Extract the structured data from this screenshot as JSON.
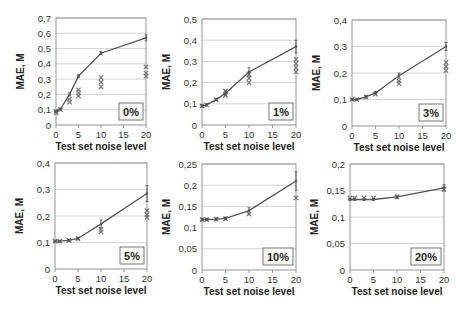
{
  "chart_data": [
    {
      "type": "line",
      "tag": "0%",
      "xlabel": "Test set noise level",
      "ylabel": "MAE, M",
      "xlim": [
        0,
        20
      ],
      "ylim": [
        0,
        0.7
      ],
      "xticks": [
        "0",
        "5",
        "10",
        "15",
        "20"
      ],
      "yticks": [
        "0",
        "0,1",
        "0,2",
        "0,3",
        "0,4",
        "0,5",
        "0,6",
        "0,7"
      ],
      "grid": true,
      "series": [
        {
          "name": "line",
          "x": [
            0,
            1,
            3,
            5,
            10,
            20
          ],
          "y": [
            0.09,
            0.105,
            0.2,
            0.32,
            0.47,
            0.57
          ],
          "err": [
            0.005,
            0.005,
            0.01,
            0.01,
            0.01,
            0.02
          ]
        },
        {
          "name": "markers",
          "x": [
            0,
            0,
            1,
            3,
            3,
            5,
            5,
            5,
            10,
            10,
            10,
            20,
            20,
            20
          ],
          "y": [
            0.08,
            0.09,
            0.1,
            0.15,
            0.17,
            0.19,
            0.21,
            0.23,
            0.25,
            0.28,
            0.31,
            0.32,
            0.34,
            0.38
          ]
        }
      ]
    },
    {
      "type": "line",
      "tag": "1%",
      "xlabel": "Test set noise level",
      "ylabel": "MAE, M",
      "xlim": [
        0,
        20
      ],
      "ylim": [
        0,
        0.5
      ],
      "xticks": [
        "0",
        "5",
        "10",
        "15",
        "20"
      ],
      "yticks": [
        "0",
        "0,1",
        "0,2",
        "0,3",
        "0,4",
        "0,5"
      ],
      "grid": true,
      "series": [
        {
          "name": "line",
          "x": [
            0,
            1,
            3,
            5,
            10,
            20
          ],
          "y": [
            0.09,
            0.095,
            0.12,
            0.15,
            0.25,
            0.37
          ],
          "err": [
            0.005,
            0.005,
            0.005,
            0.01,
            0.02,
            0.03
          ]
        },
        {
          "name": "markers",
          "x": [
            0,
            1,
            3,
            5,
            5,
            10,
            10,
            10,
            20,
            20,
            20,
            20
          ],
          "y": [
            0.09,
            0.095,
            0.12,
            0.14,
            0.16,
            0.2,
            0.22,
            0.24,
            0.25,
            0.27,
            0.29,
            0.31
          ]
        }
      ]
    },
    {
      "type": "line",
      "tag": "3%",
      "xlabel": "Test set noise level",
      "ylabel": "MAE, M",
      "xlim": [
        0,
        20
      ],
      "ylim": [
        0,
        0.4
      ],
      "xticks": [
        "0",
        "5",
        "10",
        "15",
        "20"
      ],
      "yticks": [
        "0",
        "0,1",
        "0,2",
        "0,3",
        "0,4"
      ],
      "grid": true,
      "series": [
        {
          "name": "line",
          "x": [
            0,
            1,
            3,
            5,
            10,
            20
          ],
          "y": [
            0.1,
            0.1,
            0.11,
            0.125,
            0.19,
            0.3
          ],
          "err": [
            0.003,
            0.003,
            0.005,
            0.005,
            0.01,
            0.015
          ]
        },
        {
          "name": "markers",
          "x": [
            0,
            1,
            3,
            5,
            10,
            10,
            20,
            20,
            20
          ],
          "y": [
            0.1,
            0.1,
            0.11,
            0.12,
            0.16,
            0.17,
            0.21,
            0.225,
            0.24
          ]
        }
      ]
    },
    {
      "type": "line",
      "tag": "5%",
      "xlabel": "Test set noise level",
      "ylabel": "MAE, M",
      "xlim": [
        0,
        20
      ],
      "ylim": [
        0,
        0.4
      ],
      "xticks": [
        "0",
        "5",
        "10",
        "15",
        "20"
      ],
      "yticks": [
        "0",
        "0,1",
        "0,2",
        "0,3",
        "0,4"
      ],
      "grid": true,
      "series": [
        {
          "name": "line",
          "x": [
            0,
            1,
            3,
            5,
            10,
            20
          ],
          "y": [
            0.105,
            0.105,
            0.108,
            0.115,
            0.17,
            0.285
          ],
          "err": [
            0.003,
            0.003,
            0.003,
            0.005,
            0.015,
            0.03
          ]
        },
        {
          "name": "markers",
          "x": [
            0,
            1,
            3,
            5,
            10,
            10,
            20,
            20,
            20
          ],
          "y": [
            0.105,
            0.105,
            0.108,
            0.115,
            0.14,
            0.15,
            0.195,
            0.205,
            0.22
          ]
        }
      ]
    },
    {
      "type": "line",
      "tag": "10%",
      "xlabel": "Test set noise level",
      "ylabel": "MAE, M",
      "xlim": [
        0,
        20
      ],
      "ylim": [
        0,
        0.25
      ],
      "xticks": [
        "0",
        "5",
        "10",
        "15",
        "20"
      ],
      "yticks": [
        "0",
        "0,05",
        "0,1",
        "0,15",
        "0,2",
        "0,25"
      ],
      "grid": true,
      "series": [
        {
          "name": "line",
          "x": [
            0,
            1,
            3,
            5,
            10,
            20
          ],
          "y": [
            0.119,
            0.119,
            0.12,
            0.122,
            0.14,
            0.21
          ],
          "err": [
            0.003,
            0.003,
            0.003,
            0.003,
            0.007,
            0.022
          ]
        },
        {
          "name": "markers",
          "x": [
            0,
            1,
            3,
            5,
            10,
            20
          ],
          "y": [
            0.119,
            0.119,
            0.12,
            0.121,
            0.132,
            0.17
          ]
        }
      ]
    },
    {
      "type": "line",
      "tag": "20%",
      "xlabel": "Test set noise level",
      "ylabel": "MAE, M",
      "xlim": [
        0,
        20
      ],
      "ylim": [
        0,
        0.2
      ],
      "xticks": [
        "0",
        "5",
        "10",
        "15",
        "20"
      ],
      "yticks": [
        "0",
        "0,05",
        "0,1",
        "0,15",
        "0,2"
      ],
      "grid": true,
      "series": [
        {
          "name": "line",
          "x": [
            0,
            1,
            3,
            5,
            10,
            20
          ],
          "y": [
            0.133,
            0.133,
            0.133,
            0.133,
            0.138,
            0.155
          ],
          "err": [
            0.002,
            0.002,
            0.002,
            0.002,
            0.003,
            0.006
          ]
        },
        {
          "name": "markers",
          "x": [
            0,
            1,
            3,
            5,
            10,
            20
          ],
          "y": [
            0.136,
            0.136,
            0.136,
            0.136,
            0.138,
            0.152
          ]
        }
      ]
    }
  ]
}
